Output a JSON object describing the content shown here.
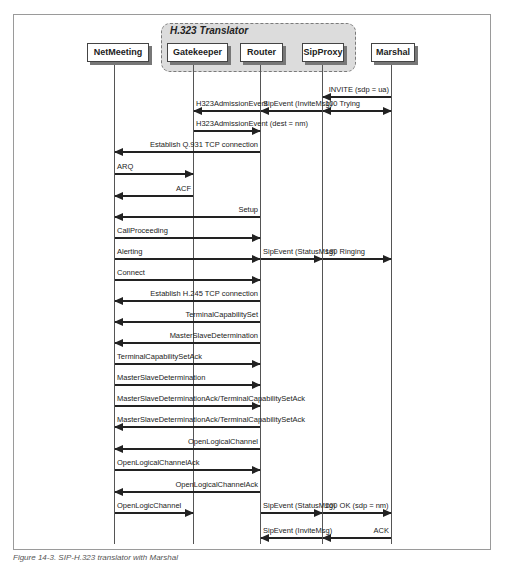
{
  "group": {
    "title": "H.323 Translator"
  },
  "actors": [
    {
      "name": "NetMeeting",
      "x": 87,
      "w": 62,
      "lx": 114
    },
    {
      "name": "Gatekeeper",
      "x": 167,
      "w": 61,
      "lx": 193
    },
    {
      "name": "Router",
      "x": 240,
      "w": 43,
      "lx": 260
    },
    {
      "name": "SipProxy",
      "x": 302,
      "w": 42,
      "lx": 322
    },
    {
      "name": "Marshal",
      "x": 371,
      "w": 44,
      "lx": 391
    }
  ],
  "messages": [
    {
      "label": "INVITE (sdp = ua)",
      "from": 4,
      "to": 3,
      "y": 96,
      "align": "right"
    },
    {
      "label": "H323AdmissionEvent",
      "from": 2,
      "to": 1,
      "y": 110,
      "align": "left"
    },
    {
      "label": "SipEvent (InviteMsg)",
      "from": 3,
      "to": 2,
      "y": 110,
      "align": "left"
    },
    {
      "label": "100 Trying",
      "from": 3,
      "to": 4,
      "y": 110,
      "align": "left",
      "both": true
    },
    {
      "label": "H323AdmissionEvent (dest = nm)",
      "from": 1,
      "to": 2,
      "y": 130,
      "align": "left"
    },
    {
      "label": "Establish Q.931 TCP connection",
      "from": 2,
      "to": 0,
      "y": 151,
      "align": "right"
    },
    {
      "label": "ARQ",
      "from": 0,
      "to": 1,
      "y": 173,
      "align": "left"
    },
    {
      "label": "ACF",
      "from": 1,
      "to": 0,
      "y": 195,
      "align": "right"
    },
    {
      "label": "Setup",
      "from": 2,
      "to": 0,
      "y": 216,
      "align": "right"
    },
    {
      "label": "CallProceeding",
      "from": 0,
      "to": 2,
      "y": 237,
      "align": "left"
    },
    {
      "label": "Alerting",
      "from": 0,
      "to": 2,
      "y": 258,
      "align": "left"
    },
    {
      "label": "SipEvent (StatusMsg)",
      "from": 2,
      "to": 3,
      "y": 258,
      "align": "left"
    },
    {
      "label": "180 Ringing",
      "from": 3,
      "to": 4,
      "y": 258,
      "align": "left"
    },
    {
      "label": "Connect",
      "from": 0,
      "to": 2,
      "y": 279,
      "align": "left"
    },
    {
      "label": "Establish H.245 TCP connection",
      "from": 2,
      "to": 0,
      "y": 300,
      "align": "right"
    },
    {
      "label": "TerminalCapabilitySet",
      "from": 2,
      "to": 0,
      "y": 321,
      "align": "right"
    },
    {
      "label": "MasterSlaveDetermination",
      "from": 2,
      "to": 0,
      "y": 342,
      "align": "right"
    },
    {
      "label": "TerminalCapabilitySetAck",
      "from": 0,
      "to": 2,
      "y": 363,
      "align": "left"
    },
    {
      "label": "MasterSlaveDetermination",
      "from": 0,
      "to": 2,
      "y": 384,
      "align": "left"
    },
    {
      "label": "MasterSlaveDeterminationAck/TerminalCapabilitySetAck",
      "from": 0,
      "to": 2,
      "y": 405,
      "align": "left"
    },
    {
      "label": "MasterSlaveDeterminationAck/TerminalCapabilitySetAck",
      "from": 2,
      "to": 0,
      "y": 426,
      "align": "left"
    },
    {
      "label": "OpenLogicalChannel",
      "from": 2,
      "to": 0,
      "y": 448,
      "align": "right"
    },
    {
      "label": "OpenLogicalChannelAck",
      "from": 0,
      "to": 2,
      "y": 469,
      "align": "left"
    },
    {
      "label": "OpenLogicalChannelAck",
      "from": 2,
      "to": 0,
      "y": 491,
      "align": "right"
    },
    {
      "label": "OpenLogicChannel",
      "from": 0,
      "to": 1,
      "y": 512,
      "align": "left"
    },
    {
      "label": "SipEvent (StatusMsg)",
      "from": 2,
      "to": 3,
      "y": 512,
      "align": "left"
    },
    {
      "label": "200 OK (sdp = nm)",
      "from": 3,
      "to": 4,
      "y": 512,
      "align": "left"
    },
    {
      "label": "SipEvent (InviteMsg)",
      "from": 3,
      "to": 2,
      "y": 537,
      "align": "left"
    },
    {
      "label": "ACK",
      "from": 4,
      "to": 3,
      "y": 537,
      "align": "right"
    }
  ],
  "caption": "Figure 14-3. SIP-H.323 translator with Marshal"
}
